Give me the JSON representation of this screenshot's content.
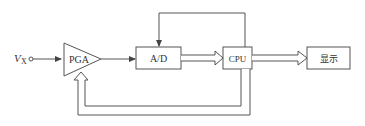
{
  "diagram": {
    "input": {
      "label_main": "V",
      "label_sub": "X"
    },
    "blocks": {
      "pga": {
        "label": "PGA"
      },
      "adc": {
        "label": "A/D"
      },
      "cpu": {
        "label": "CPU"
      },
      "display": {
        "label": "显示"
      }
    },
    "colors": {
      "stroke": "#555555",
      "text": "#333333",
      "background": "#ffffff"
    }
  }
}
